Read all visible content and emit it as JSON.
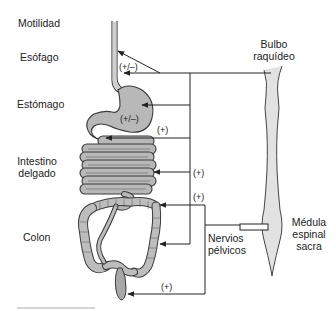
{
  "diagram": {
    "type": "physiology-schematic",
    "title_label": "Motilidad",
    "organs": [
      {
        "id": "esofago",
        "label": "Esófago"
      },
      {
        "id": "estomago",
        "label": "Estómago"
      },
      {
        "id": "intestino",
        "label_line1": "Intestino",
        "label_line2": "delgado"
      },
      {
        "id": "colon",
        "label": "Colon"
      }
    ],
    "nervous_structures": {
      "bulbo": {
        "line1": "Bulbo",
        "line2": "raquídeo"
      },
      "medula": {
        "line1": "Médula",
        "line2": "espinal",
        "line3": "sacra"
      },
      "nervios": {
        "line1": "Nervios",
        "line2": "pélvicos"
      }
    },
    "effects": {
      "esofago": "(+/–)",
      "estomago": "(+/–)",
      "intestino_upper": "(+)",
      "intestino_lower": "(+)",
      "colon_upper": "(+)",
      "recto": "(+)"
    },
    "colors": {
      "organ_fill": "#b8b8b8",
      "organ_stroke": "#3a3a3a",
      "cord_fill": "#e2e2e2",
      "line": "#222222"
    }
  }
}
